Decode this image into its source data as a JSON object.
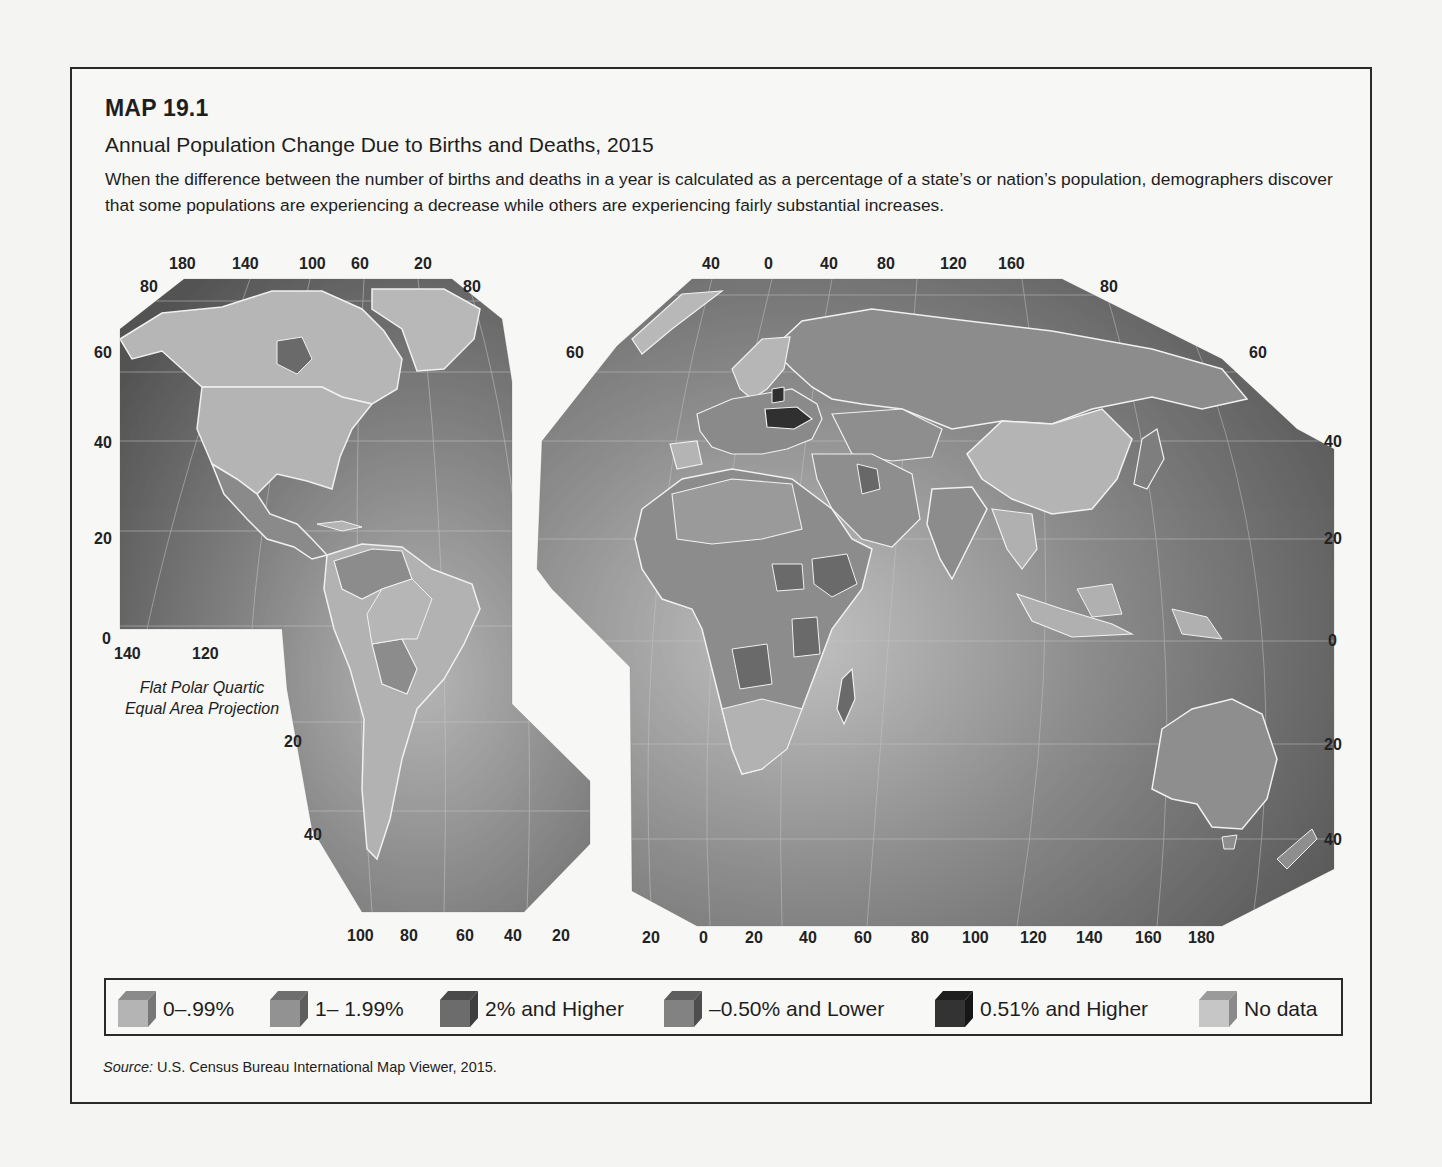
{
  "header": {
    "map_label": "MAP 19.1",
    "title": "Annual Population Change Due to Births and Deaths, 2015",
    "description": "When the difference between the number of births and deaths in a year is calculated as a percentage of a state’s or nation’s population, demographers discover that some populations are experiencing a decrease while others are experiencing fairly substantial increases."
  },
  "projection": {
    "line1": "Flat Polar Quartic",
    "line2": "Equal Area Projection"
  },
  "colors": {
    "ocean_dark": "#5a5a5a",
    "ocean_light": "#a8a8a8",
    "land_0_099": "#b4b4b4",
    "land_1_199": "#8e8e8e",
    "land_2_higher": "#6c6c6c",
    "land_neg050_lower": "#7e7e7e",
    "land_051_higher": "#303030",
    "land_no_data": "#c4c4c4",
    "border": "#f0f0f0",
    "frame": "#2a2a2a"
  },
  "legend": {
    "items": [
      {
        "label": "0–.99%",
        "top": "#8a8a8a",
        "front": "#b4b4b4",
        "side": "#777777"
      },
      {
        "label": "1– 1.99%",
        "top": "#6e6e6e",
        "front": "#929292",
        "side": "#5e5e5e"
      },
      {
        "label": "2% and Higher",
        "top": "#4a4a4a",
        "front": "#6c6c6c",
        "side": "#3e3e3e"
      },
      {
        "label": "–0.50% and Lower",
        "top": "#5e5e5e",
        "front": "#828282",
        "side": "#4e4e4e"
      },
      {
        "label": "0.51% and Higher",
        "top": "#1e1e1e",
        "front": "#333333",
        "side": "#161616"
      },
      {
        "label": "No data",
        "top": "#9a9a9a",
        "front": "#c6c6c6",
        "side": "#8a8a8a"
      }
    ]
  },
  "source": {
    "prefix": "Source:",
    "text": " U.S. Census Bureau International Map Viewer, 2015."
  },
  "axes": {
    "americas_top_lon": [
      "180",
      "140",
      "100",
      "60",
      "20"
    ],
    "americas_top_lat_left": "80",
    "americas_top_lat_right": "80",
    "americas_left_lat": [
      "60",
      "40",
      "20",
      "0"
    ],
    "americas_mid_lon": [
      "140",
      "120"
    ],
    "americas_right_lat": [
      "20",
      "40"
    ],
    "americas_bottom_lon": [
      "100",
      "80",
      "60",
      "40",
      "20"
    ],
    "eurasia_top_lon": [
      "40",
      "0",
      "40",
      "80",
      "120",
      "160"
    ],
    "eurasia_top_lat_right": "80",
    "eurasia_left_lat": "60",
    "eurasia_right_lat": [
      "60",
      "40",
      "20",
      "0",
      "20",
      "40"
    ],
    "eurasia_bottom_lon": [
      "20",
      "0",
      "20",
      "40",
      "60",
      "80",
      "100",
      "120",
      "140",
      "160",
      "180"
    ]
  }
}
